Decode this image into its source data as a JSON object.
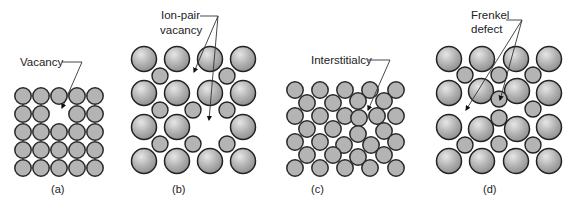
{
  "figure": {
    "panels": [
      {
        "id": "a",
        "caption": "(a)",
        "label": "Vacancy",
        "description": "Simple square lattice with one missing atom"
      },
      {
        "id": "b",
        "caption": "(b)",
        "label_line1": "Ion-pair",
        "label_line2": "vacancy",
        "description": "Ionic lattice with a missing cation and a missing anion"
      },
      {
        "id": "c",
        "caption": "(c)",
        "label": "Interstitialcy",
        "description": "Close-packed lattice with an extra atom squeezed in"
      },
      {
        "id": "d",
        "caption": "(d)",
        "label_line1": "Frenkel",
        "label_line2": "defect",
        "description": "Ionic lattice with an ion displaced to an interstitial site"
      }
    ],
    "colors": {
      "atom_fill": "#b4b4b4",
      "atom_stroke": "#2a2a2a",
      "leader_line": "#333333",
      "text": "#222222",
      "background": "#ffffff"
    }
  }
}
